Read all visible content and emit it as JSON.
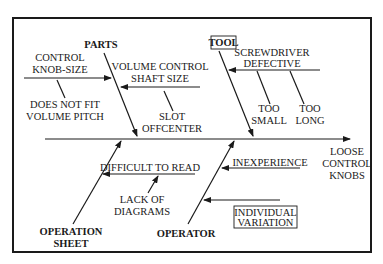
{
  "diagram": {
    "type": "fishbone",
    "effect": {
      "lines": [
        "LOOSE",
        "CONTROL",
        "KNOBS"
      ]
    },
    "categories": [
      {
        "name": "PARTS",
        "boxed": false,
        "causes": [
          {
            "label_lines": [
              "CONTROL",
              "KNOB-SIZE"
            ],
            "sub_causes": [
              {
                "label_lines": [
                  "DOES NOT FIT",
                  "VOLUME PITCH"
                ]
              }
            ]
          },
          {
            "label_lines": [
              "VOLUME CONTROL",
              "SHAFT SIZE"
            ],
            "sub_causes": [
              {
                "label_lines": [
                  "SLOT",
                  "OFFCENTER"
                ]
              }
            ]
          }
        ]
      },
      {
        "name": "TOOL",
        "boxed": true,
        "causes": [
          {
            "label_lines": [
              "SCREWDRIVER",
              "DEFECTIVE"
            ],
            "sub_causes": [
              {
                "label_lines": [
                  "TOO",
                  "SMALL"
                ]
              },
              {
                "label_lines": [
                  "TOO",
                  "LONG"
                ]
              }
            ]
          }
        ]
      },
      {
        "name_lines": [
          "OPERATION",
          "SHEET"
        ],
        "boxed": false,
        "causes": [
          {
            "label_lines": [
              "DIFFICULT TO READ"
            ],
            "sub_causes": [
              {
                "label_lines": [
                  "LACK OF",
                  "DIAGRAMS"
                ]
              }
            ]
          }
        ]
      },
      {
        "name": "OPERATOR",
        "boxed": false,
        "causes": [
          {
            "label_lines": [
              "INEXPERIENCE"
            ],
            "sub_causes": []
          },
          {
            "label_lines": [
              "INDIVIDUAL",
              "VARIATION"
            ],
            "boxed": true,
            "sub_causes": []
          }
        ]
      }
    ]
  },
  "labels": {
    "effect_1": "LOOSE",
    "effect_2": "CONTROL",
    "effect_3": "KNOBS",
    "parts": "PARTS",
    "tool": "TOOL",
    "op_sheet_1": "OPERATION",
    "op_sheet_2": "SHEET",
    "operator": "OPERATOR",
    "knob_1": "CONTROL",
    "knob_2": "KNOB-SIZE",
    "nofit_1": "DOES NOT FIT",
    "nofit_2": "VOLUME PITCH",
    "shaft_1": "VOLUME CONTROL",
    "shaft_2": "SHAFT SIZE",
    "slot_1": "SLOT",
    "slot_2": "OFFCENTER",
    "screw_1": "SCREWDRIVER",
    "screw_2": "DEFECTIVE",
    "small_1": "TOO",
    "small_2": "SMALL",
    "long_1": "TOO",
    "long_2": "LONG",
    "difficult": "DIFFICULT TO READ",
    "lack_1": "LACK OF",
    "lack_2": "DIAGRAMS",
    "inexperience": "INEXPERIENCE",
    "indiv_1": "INDIVIDUAL",
    "indiv_2": "VARIATION"
  }
}
